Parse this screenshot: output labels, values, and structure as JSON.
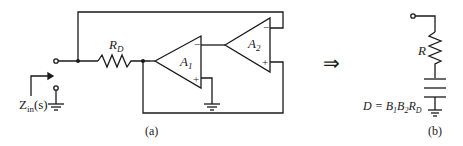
{
  "figure_a": {
    "label": "(a)",
    "resistor_label": "R",
    "resistor_sub": "D",
    "opamp1": {
      "label": "A",
      "sub": "1",
      "minus": "−",
      "plus": "+"
    },
    "opamp2": {
      "label": "A",
      "sub": "2",
      "minus": "−",
      "plus": "+"
    },
    "impedance_label": "Z",
    "impedance_sub": "in",
    "impedance_arg": "(s)"
  },
  "arrow": "⇒",
  "figure_b": {
    "label": "(b)",
    "resistor_label": "R",
    "fdnr_label_D": "D = B",
    "fdnr_sub1": "1",
    "fdnr_B2": "B",
    "fdnr_sub2": "2",
    "fdnr_R": "R",
    "fdnr_subD": "D"
  }
}
